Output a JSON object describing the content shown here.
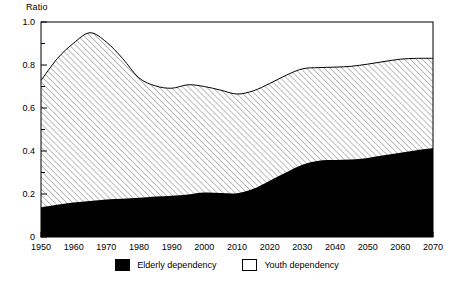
{
  "chart_data": {
    "type": "area",
    "title": "",
    "subtitle": "",
    "xlabel": "",
    "ylabel": "Ratio",
    "stacked": true,
    "grid": false,
    "legend_position": "bottom-center",
    "xlim": [
      1950,
      2070
    ],
    "ylim": [
      0,
      1.0
    ],
    "x_tick_labels": [
      "1950",
      "1960",
      "1970",
      "1980",
      "1990",
      "2000",
      "2010",
      "2020",
      "2030",
      "2040",
      "2050",
      "2060",
      "2070"
    ],
    "x_ticks": [
      1950,
      1960,
      1970,
      1980,
      1990,
      2000,
      2010,
      2020,
      2030,
      2040,
      2050,
      2060,
      2070
    ],
    "y_tick_labels": [
      "0",
      "0.2",
      "0.4",
      "0.6",
      "0.8",
      "1.0"
    ],
    "y_ticks": [
      0,
      0.2,
      0.4,
      0.6,
      0.8,
      1.0
    ],
    "y_minor_ticks": [
      0.1,
      0.3,
      0.5,
      0.7,
      0.9
    ],
    "x": [
      1950,
      1955,
      1960,
      1965,
      1970,
      1975,
      1980,
      1985,
      1990,
      1995,
      2000,
      2005,
      2010,
      2015,
      2020,
      2025,
      2030,
      2035,
      2040,
      2045,
      2050,
      2055,
      2060,
      2065,
      2070
    ],
    "series": [
      {
        "name": "Elderly dependency",
        "fill": "solid-black",
        "color": "#000000",
        "values": [
          0.138,
          0.15,
          0.16,
          0.168,
          0.175,
          0.178,
          0.182,
          0.188,
          0.192,
          0.198,
          0.207,
          0.205,
          0.203,
          0.224,
          0.262,
          0.3,
          0.336,
          0.355,
          0.358,
          0.36,
          0.368,
          0.38,
          0.392,
          0.404,
          0.414
        ]
      },
      {
        "name": "Youth dependency",
        "fill": "diagonal-hatch",
        "color": "#ffffff",
        "values": [
          0.59,
          0.68,
          0.742,
          0.782,
          0.732,
          0.652,
          0.558,
          0.515,
          0.5,
          0.51,
          0.493,
          0.478,
          0.462,
          0.456,
          0.452,
          0.452,
          0.446,
          0.433,
          0.432,
          0.434,
          0.436,
          0.436,
          0.435,
          0.427,
          0.417
        ]
      }
    ],
    "total_values": [
      0.728,
      0.83,
      0.902,
      0.95,
      0.907,
      0.83,
      0.74,
      0.703,
      0.692,
      0.708,
      0.7,
      0.683,
      0.665,
      0.68,
      0.714,
      0.752,
      0.782,
      0.788,
      0.79,
      0.794,
      0.804,
      0.816,
      0.827,
      0.831,
      0.831
    ]
  },
  "legend": {
    "entries": [
      {
        "label": "Elderly dependency",
        "swatch": "solid-black-swatch"
      },
      {
        "label": "Youth dependency",
        "swatch": "hatched-swatch"
      }
    ]
  }
}
